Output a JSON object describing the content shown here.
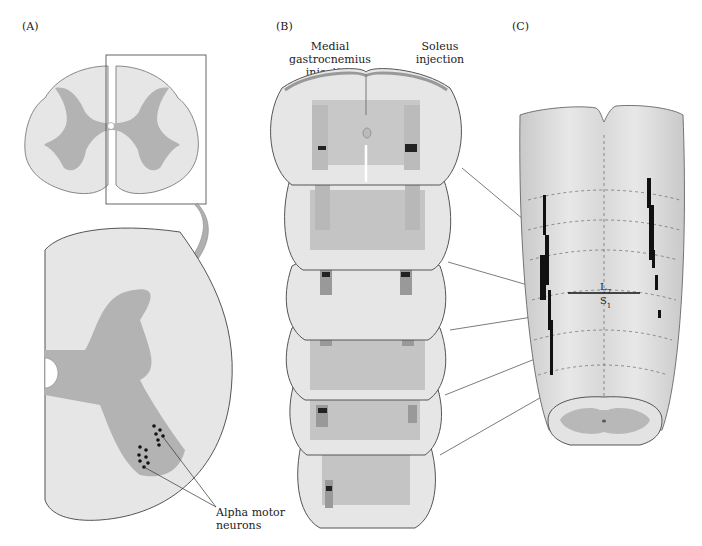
{
  "panels": {
    "a": {
      "label": "(A)",
      "annotation": "Alpha motor neurons"
    },
    "b": {
      "label": "(B)",
      "left_header": [
        "Medial gastrocnemius",
        "injection"
      ],
      "right_header": [
        "Soleus",
        "injection"
      ]
    },
    "c": {
      "label": "(C)",
      "level_upper": "L7",
      "level_lower": "S1"
    }
  },
  "colors": {
    "white_matter": "#e6e6e6",
    "gray_matter": "#b3b3b3",
    "outline": "#555555",
    "rim": "#999999",
    "label_dots": "#111111"
  }
}
